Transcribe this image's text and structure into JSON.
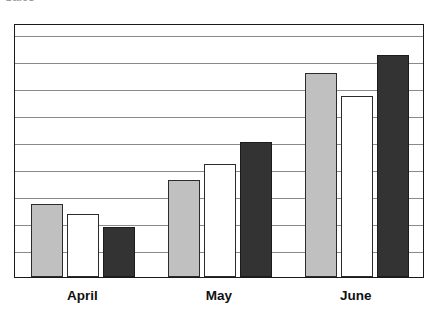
{
  "figure": {
    "clipped_title_fragment": "Sales",
    "background_color": "#ffffff",
    "frame_color": "#1a1a1a",
    "gridline_color": "#8a8a8a"
  },
  "chart_data": {
    "type": "bar",
    "title": "Sales",
    "xlabel": "",
    "ylabel": "",
    "categories": [
      "April",
      "May",
      "June"
    ],
    "series": [
      {
        "name": "Series 1",
        "color": "#c0c0c0",
        "values": [
          2.7,
          3.6,
          7.55
        ]
      },
      {
        "name": "Series 2",
        "color": "#ffffff",
        "values": [
          2.35,
          4.2,
          6.7
        ]
      },
      {
        "name": "Series 3",
        "color": "#333333",
        "values": [
          1.85,
          5.0,
          8.2
        ]
      }
    ],
    "ylim": [
      0,
      9.4
    ],
    "yticks": [
      0,
      1,
      2,
      3,
      4,
      5,
      6,
      7,
      8,
      9
    ],
    "grid": true,
    "grid_axis": "y",
    "legend": false,
    "axis_tick_labels": false
  },
  "axis": {
    "category_labels": [
      "April",
      "May",
      "June"
    ]
  }
}
